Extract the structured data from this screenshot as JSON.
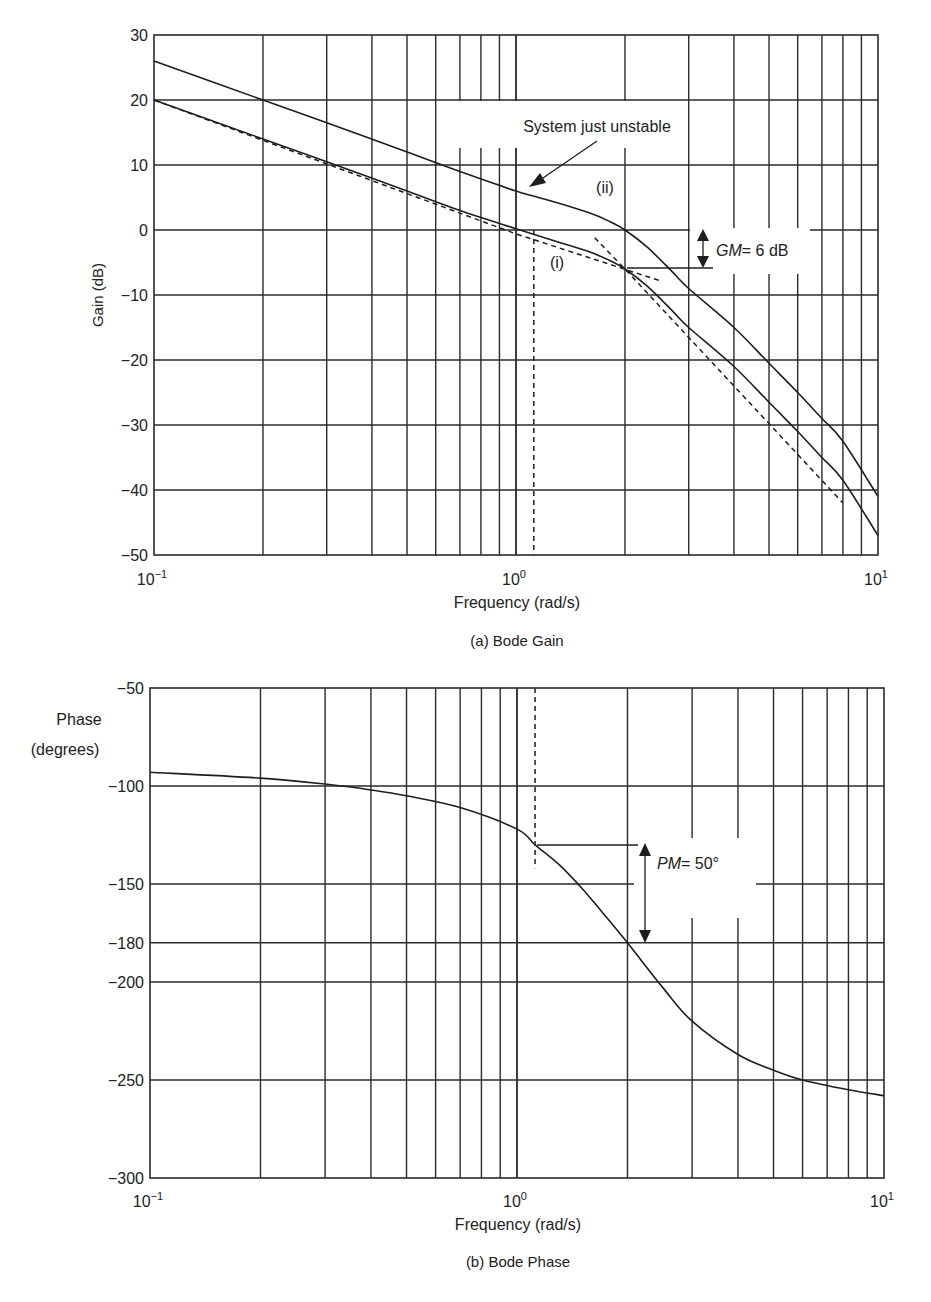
{
  "chart_data": [
    {
      "type": "line",
      "title": "(a) Bode Gain",
      "xlabel": "Frequency (rad/s)",
      "ylabel": "Gain (dB)",
      "xscale": "log",
      "xlim": [
        0.1,
        10
      ],
      "ylim": [
        -50,
        30
      ],
      "xticks": [
        0.1,
        1,
        10
      ],
      "xtick_labels": [
        "10^-1",
        "10^0",
        "10^1"
      ],
      "yticks": [
        30,
        20,
        10,
        0,
        -10,
        -20,
        -30,
        -40,
        -50
      ],
      "grid": true,
      "series": [
        {
          "name": "(ii) System just unstable",
          "style": "solid",
          "x": [
            0.1,
            0.2,
            0.3,
            0.5,
            0.7,
            1.0,
            1.3,
            1.6,
            1.8,
            2.0,
            2.3,
            2.7,
            3.0,
            4.0,
            5.0,
            6.0,
            7.0,
            8.0,
            10.0
          ],
          "values": [
            26,
            20,
            16.5,
            12,
            9,
            6,
            4.2,
            2.6,
            1.4,
            0,
            -2.6,
            -6.4,
            -9,
            -15,
            -20.5,
            -25,
            -29,
            -32.5,
            -41
          ]
        },
        {
          "name": "(i)",
          "style": "solid",
          "x": [
            0.1,
            0.2,
            0.3,
            0.5,
            0.7,
            1.0,
            1.3,
            1.6,
            1.8,
            2.0,
            2.3,
            2.7,
            3.0,
            4.0,
            5.0,
            6.0,
            7.0,
            8.0,
            10.0
          ],
          "values": [
            20,
            14,
            10.5,
            6,
            3,
            0.2,
            -1.8,
            -3.4,
            -4.6,
            -6,
            -8.6,
            -12.4,
            -15,
            -21,
            -26.5,
            -31,
            -35,
            -38.5,
            -47
          ]
        },
        {
          "name": "Low-frequency asymptote",
          "style": "dashed",
          "x": [
            0.1,
            1.0,
            2.5
          ],
          "values": [
            20,
            -0.6,
            -7.8
          ]
        },
        {
          "name": "High-frequency asymptote",
          "style": "dashed",
          "x": [
            1.65,
            2.0,
            4.0,
            8.0
          ],
          "values": [
            -1.2,
            -6,
            -24,
            -42
          ]
        }
      ],
      "annotations": [
        {
          "text": "System just unstable",
          "points_to": "(ii)",
          "x": 1.0,
          "y": 15
        },
        {
          "text": "(ii)",
          "x": 1.75,
          "y": 3
        },
        {
          "text": "(i)",
          "x": 1.35,
          "y": -5.5
        },
        {
          "text": "GM = 6 dB",
          "x": 3.0,
          "y_from": 0,
          "y_to": -6,
          "kind": "double-arrow"
        },
        {
          "text": "gain crossover dashed marker",
          "x": 1.12,
          "y_from": 0,
          "y_to": -50,
          "kind": "vertical-dashed"
        }
      ]
    },
    {
      "type": "line",
      "title": "(b) Bode Phase",
      "xlabel": "Frequency (rad/s)",
      "ylabel": "Phase (degrees)",
      "xscale": "log",
      "xlim": [
        0.1,
        10
      ],
      "ylim": [
        -300,
        -50
      ],
      "xticks": [
        0.1,
        1,
        10
      ],
      "xtick_labels": [
        "10^-1",
        "10^0",
        "10^1"
      ],
      "yticks": [
        -50,
        -100,
        -150,
        -180,
        -200,
        -250,
        -300
      ],
      "grid": true,
      "series": [
        {
          "name": "Phase",
          "style": "solid",
          "x": [
            0.1,
            0.2,
            0.3,
            0.4,
            0.5,
            0.7,
            1.0,
            1.12,
            1.3,
            1.5,
            1.7,
            2.0,
            2.5,
            3.0,
            4.0,
            5.0,
            6.0,
            8.0,
            10.0
          ],
          "values": [
            -93,
            -96,
            -99,
            -102,
            -105,
            -111,
            -122,
            -130,
            -140,
            -152,
            -164,
            -180,
            -203,
            -220,
            -237,
            -245,
            -250,
            -255,
            -258
          ]
        }
      ],
      "annotations": [
        {
          "text": "PM = 50°",
          "x": 2.3,
          "y_from": -130,
          "y_to": -180,
          "kind": "double-arrow"
        },
        {
          "text": "gain crossover dashed marker",
          "x": 1.12,
          "y_from": -50,
          "y_to": -142,
          "kind": "vertical-dashed"
        }
      ]
    }
  ],
  "labels": {
    "gain_ylabel": "Gain (dB)",
    "gain_xlabel": "Frequency (rad/s)",
    "gain_caption": "(a) Bode Gain",
    "gain_note": "System just unstable",
    "gain_ii": "(ii)",
    "gain_i": "(i)",
    "gm_label_italic": "GM",
    "gm_label_rest": "= 6 dB",
    "phase_ylabel_1": "Phase",
    "phase_ylabel_2": "(degrees)",
    "phase_xlabel": "Frequency (rad/s)",
    "phase_caption": "(b) Bode Phase",
    "pm_label_italic": "PM",
    "pm_label_rest": "= 50°",
    "x_tick_base": "10",
    "x_tick_exps": [
      "−1",
      "0",
      "1"
    ]
  }
}
